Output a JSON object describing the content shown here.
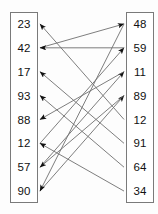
{
  "diagram": {
    "type": "arrow-mapping",
    "left_column": {
      "name": "left-value-column",
      "values": [
        "23",
        "42",
        "17",
        "93",
        "88",
        "12",
        "57",
        "90"
      ]
    },
    "right_column": {
      "name": "right-value-column",
      "values": [
        "48",
        "59",
        "11",
        "89",
        "12",
        "91",
        "64",
        "34"
      ]
    },
    "colors": {
      "box_border": "#7a7a7a",
      "edge_line": "#6f6f6f",
      "arrow_head": "#111111",
      "text": "#111111",
      "background": "#fdfdfd"
    },
    "edges": [
      {
        "from_side": "left",
        "from_index": 1,
        "from_value": "42",
        "to_side": "right",
        "to_index": 0,
        "to_value": "48"
      },
      {
        "from_side": "left",
        "from_index": 5,
        "from_value": "12",
        "to_side": "right",
        "to_index": 1,
        "to_value": "59"
      },
      {
        "from_side": "left",
        "from_index": 6,
        "from_value": "57",
        "to_side": "right",
        "to_index": 2,
        "to_value": "11"
      },
      {
        "from_side": "left",
        "from_index": 7,
        "from_value": "90",
        "to_side": "right",
        "to_index": 3,
        "to_value": "89"
      },
      {
        "from_side": "right",
        "from_index": 4,
        "from_value": "12",
        "to_side": "left",
        "to_index": 0,
        "to_value": "23"
      },
      {
        "from_side": "right",
        "from_index": 5,
        "from_value": "91",
        "to_side": "left",
        "to_index": 2,
        "to_value": "17"
      },
      {
        "from_side": "right",
        "from_index": 6,
        "from_value": "64",
        "to_side": "left",
        "to_index": 3,
        "to_value": "93"
      },
      {
        "from_side": "right",
        "from_index": 7,
        "from_value": "34",
        "to_side": "left",
        "to_index": 5,
        "to_value": "12"
      },
      {
        "from_side": "right",
        "from_index": 1,
        "from_value": "59",
        "to_side": "left",
        "to_index": 1,
        "to_value": "42"
      },
      {
        "from_side": "right",
        "from_index": 2,
        "from_value": "11",
        "to_side": "left",
        "to_index": 4,
        "to_value": "88"
      },
      {
        "from_side": "right",
        "from_index": 3,
        "from_value": "89",
        "to_side": "left",
        "to_index": 6,
        "to_value": "57"
      },
      {
        "from_side": "right",
        "from_index": 0,
        "from_value": "48",
        "to_side": "left",
        "to_index": 7,
        "to_value": "90"
      }
    ]
  }
}
